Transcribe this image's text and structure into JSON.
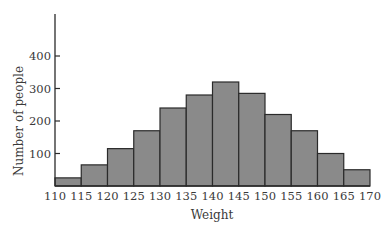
{
  "chart_data": {
    "type": "bar",
    "subtype": "histogram",
    "title": "",
    "xlabel": "Weight",
    "ylabel": "Number of people",
    "bin_edges": [
      110,
      115,
      120,
      125,
      130,
      135,
      140,
      145,
      150,
      155,
      160,
      165,
      170
    ],
    "categories": [
      "110-115",
      "115-120",
      "120-125",
      "125-130",
      "130-135",
      "135-140",
      "140-145",
      "145-150",
      "150-155",
      "155-160",
      "160-165",
      "165-170"
    ],
    "values": [
      25,
      65,
      115,
      170,
      240,
      280,
      320,
      285,
      220,
      170,
      100,
      50
    ],
    "x_ticks": [
      "110",
      "115",
      "120",
      "125",
      "130",
      "135",
      "140",
      "145",
      "150",
      "155",
      "160",
      "165",
      "170"
    ],
    "y_ticks": [
      100,
      200,
      300,
      400
    ],
    "y_tick_labels": [
      "100",
      "200",
      "300",
      "400"
    ],
    "ylim": [
      0,
      520
    ],
    "xlim": [
      110,
      170
    ],
    "grid": false,
    "legend": null,
    "colors": {
      "bar_fill": "#8a8a8a",
      "bar_edge": "#2a2a2a",
      "axis": "#2a2a2a"
    }
  }
}
